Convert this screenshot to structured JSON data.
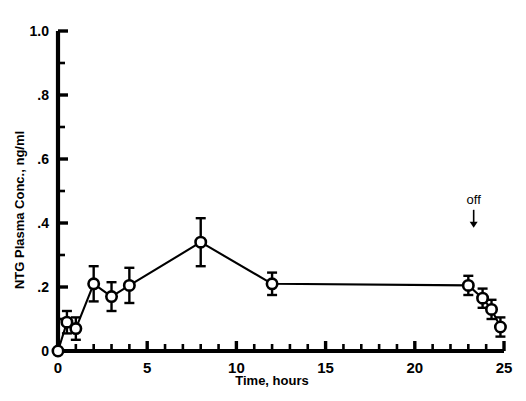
{
  "chart_data": {
    "type": "line",
    "title": "",
    "xlabel": "Time, hours",
    "ylabel": "NTG Plasma Conc., ng/ml",
    "xlim": [
      0,
      25
    ],
    "ylim": [
      0,
      1.0
    ],
    "grid": false,
    "legend": "none",
    "x_ticks": [
      0,
      5,
      10,
      15,
      20,
      25
    ],
    "x_tick_labels": [
      "0",
      "5",
      "10",
      "15",
      "20",
      "25"
    ],
    "x_minor_tick_step": 1,
    "y_ticks": [
      0,
      0.2,
      0.4,
      0.6,
      0.8,
      1.0
    ],
    "y_tick_labels": [
      "0",
      ".2",
      ".4",
      ".6",
      ".8",
      "1.0"
    ],
    "y_minor_tick_step": 0.1,
    "marker": "open-circle",
    "error_bars": "symmetric-sem",
    "series": [
      {
        "name": "NTG plasma concentration",
        "x": [
          0,
          0.5,
          1.0,
          2.0,
          3.0,
          4.0,
          8.0,
          12.0,
          23.0,
          23.8,
          24.3,
          24.8
        ],
        "values": [
          0.0,
          0.09,
          0.07,
          0.21,
          0.17,
          0.205,
          0.34,
          0.21,
          0.205,
          0.165,
          0.13,
          0.075
        ],
        "yerr": [
          0.0,
          0.035,
          0.035,
          0.055,
          0.045,
          0.055,
          0.075,
          0.035,
          0.03,
          0.03,
          0.03,
          0.03
        ]
      }
    ],
    "annotations": [
      {
        "text": "off",
        "x": 23.3,
        "y": 0.46,
        "arrow": "down",
        "arrow_to_y": 0.385
      }
    ]
  },
  "axes": {
    "y_label": "NTG Plasma Conc., ng/ml",
    "x_label": "Time, hours"
  }
}
